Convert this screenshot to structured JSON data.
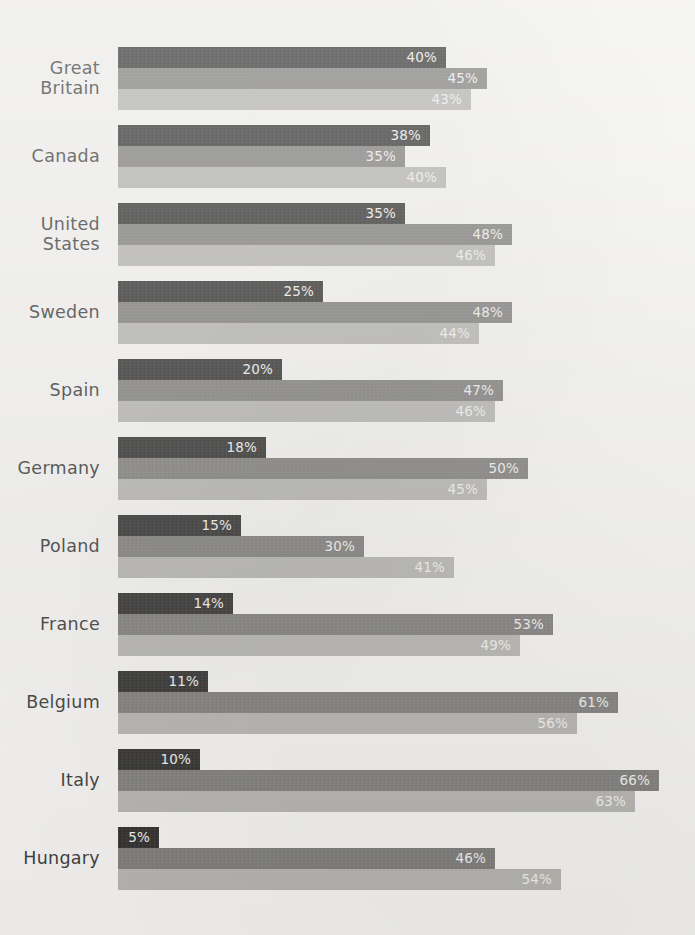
{
  "artifact": {
    "top_right_faint_text": ""
  },
  "chart_data": {
    "type": "bar",
    "orientation": "horizontal",
    "grouped": true,
    "title": "",
    "subtitle": "",
    "xlabel": "",
    "ylabel": "",
    "xlim": [
      0,
      70
    ],
    "grid": false,
    "legend_position": "none",
    "value_suffix": "%",
    "categories": [
      "Great Britain",
      "Canada",
      "United States",
      "Sweden",
      "Spain",
      "Germany",
      "Poland",
      "France",
      "Belgium",
      "Italy",
      "Hungary"
    ],
    "category_lines": [
      [
        "Great",
        "Britain"
      ],
      [
        "Canada"
      ],
      [
        "United",
        "States"
      ],
      [
        "Sweden"
      ],
      [
        "Spain"
      ],
      [
        "Germany"
      ],
      [
        "Poland"
      ],
      [
        "France"
      ],
      [
        "Belgium"
      ],
      [
        "Italy"
      ],
      [
        "Hungary"
      ]
    ],
    "series": [
      {
        "name": "series-1",
        "color": "#2d2c2b",
        "values": [
          40,
          38,
          35,
          25,
          20,
          18,
          15,
          14,
          11,
          10,
          5
        ],
        "labels": [
          "40%",
          "38%",
          "35%",
          "25%",
          "20%",
          "18%",
          "15%",
          "14%",
          "11%",
          "10%",
          "5%"
        ]
      },
      {
        "name": "series-2",
        "color": "#7b7a78",
        "values": [
          45,
          35,
          48,
          48,
          47,
          50,
          30,
          53,
          61,
          66,
          46
        ],
        "labels": [
          "45%",
          "35%",
          "48%",
          "48%",
          "47%",
          "50%",
          "30%",
          "53%",
          "61%",
          "66%",
          "46%"
        ]
      },
      {
        "name": "series-3",
        "color": "#b2b1ad",
        "values": [
          43,
          40,
          46,
          44,
          46,
          45,
          41,
          49,
          56,
          63,
          54
        ],
        "labels": [
          "43%",
          "40%",
          "46%",
          "44%",
          "46%",
          "45%",
          "41%",
          "49%",
          "56%",
          "63%",
          "54%"
        ]
      }
    ]
  },
  "layout": {
    "bar_origin_x": 118,
    "px_per_percent": 8.2,
    "bar_height": 21,
    "group_top_start": 47,
    "group_pitch": 78,
    "min_bar_px": 24
  }
}
